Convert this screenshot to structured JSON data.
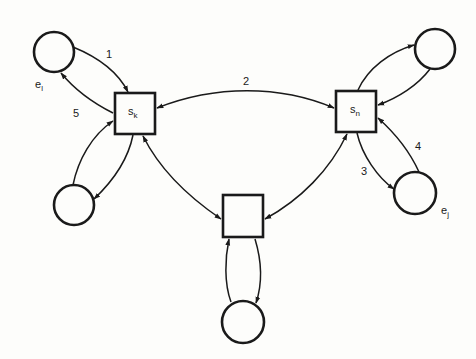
{
  "diagram": {
    "colors": {
      "stroke": "#1a1a1a",
      "background": "#fdfdfb"
    },
    "state_nodes": [
      {
        "id": "sk",
        "label": "s",
        "subscript": "k",
        "x": 115,
        "y": 93,
        "w": 40,
        "h": 41
      },
      {
        "id": "sn",
        "label": "s",
        "subscript": "n",
        "x": 336,
        "y": 91,
        "w": 40,
        "h": 41
      },
      {
        "id": "mid",
        "label": "",
        "subscript": "",
        "x": 223,
        "y": 195,
        "w": 40,
        "h": 42
      }
    ],
    "env_nodes": [
      {
        "id": "el",
        "label": "e",
        "subscript": "l",
        "cx": 54,
        "cy": 52,
        "r": 20
      },
      {
        "id": "tr",
        "label": "",
        "subscript": "",
        "cx": 435,
        "cy": 49,
        "r": 20
      },
      {
        "id": "bl",
        "label": "",
        "subscript": "",
        "cx": 74,
        "cy": 205,
        "r": 20
      },
      {
        "id": "ej",
        "label": "e",
        "subscript": "j",
        "cx": 415,
        "cy": 193,
        "r": 21
      },
      {
        "id": "bot",
        "label": "",
        "subscript": "",
        "cx": 243,
        "cy": 322,
        "r": 21
      }
    ],
    "edge_labels": [
      {
        "id": "e1",
        "text": "1"
      },
      {
        "id": "e2",
        "text": "2"
      },
      {
        "id": "e3",
        "text": "3"
      },
      {
        "id": "e4",
        "text": "4"
      },
      {
        "id": "e5",
        "text": "5"
      }
    ],
    "edges": [
      {
        "id": "e1",
        "from": "el",
        "to": "sk",
        "label": "1"
      },
      {
        "id": "e5",
        "from": "sk",
        "to": "el",
        "label": "5"
      },
      {
        "id": "e2",
        "from": "sk",
        "to": "sn",
        "label": "2",
        "bidirectional": true
      },
      {
        "id": "e3",
        "from": "sn",
        "to": "ej",
        "label": "3"
      },
      {
        "id": "e4",
        "from": "ej",
        "to": "sn",
        "label": "4"
      },
      {
        "id": "sn-tr",
        "from": "sn",
        "to": "tr"
      },
      {
        "id": "tr-sn",
        "from": "tr",
        "to": "sn"
      },
      {
        "id": "sk-bl",
        "from": "sk",
        "to": "bl"
      },
      {
        "id": "bl-sk",
        "from": "bl",
        "to": "sk"
      },
      {
        "id": "sk-mid",
        "from": "sk",
        "to": "mid",
        "bidirectional": true
      },
      {
        "id": "sn-mid",
        "from": "sn",
        "to": "mid",
        "bidirectional": true
      },
      {
        "id": "mid-bot",
        "from": "mid",
        "to": "bot"
      },
      {
        "id": "bot-mid",
        "from": "bot",
        "to": "mid"
      }
    ]
  }
}
